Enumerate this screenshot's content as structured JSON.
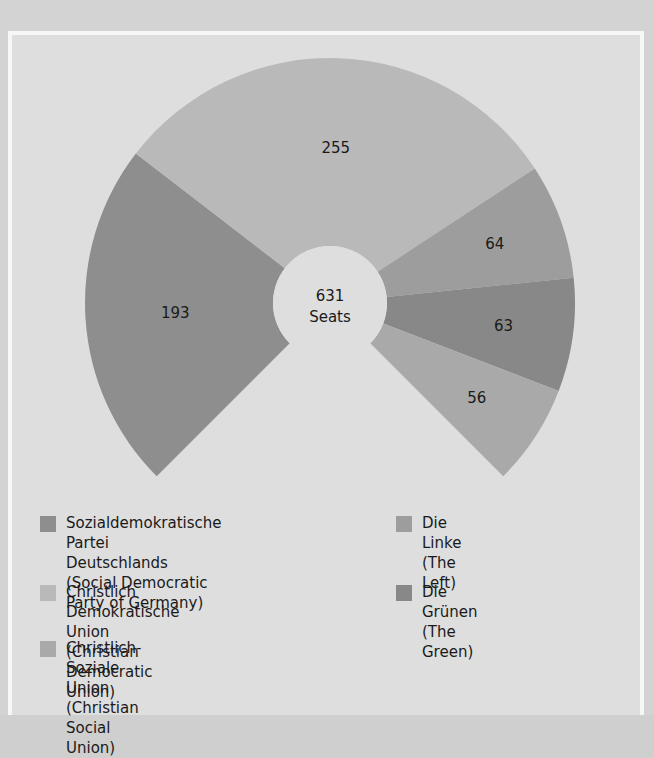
{
  "chart_data": {
    "type": "pie",
    "variant": "donut-270-degree",
    "title": "",
    "center_label": {
      "total": "631",
      "unit": "Seats"
    },
    "total_seats": 631,
    "categories": [
      "Sozialdemokratische Partei Deutschlands (Social Democratic Party of Germany)",
      "Christlich Demokratische Union (Christian Democratic Union)",
      "Die Linke (The Left)",
      "Die Grünen (The Green)",
      "Christlich-Soziale Union (Christian Social Union)"
    ],
    "values": [
      193,
      255,
      64,
      63,
      56
    ],
    "slices": [
      {
        "key": "spd",
        "label": "193",
        "value": 193,
        "color": "#8e8e8e"
      },
      {
        "key": "cdu",
        "label": "255",
        "value": 255,
        "color": "#b9b9b9"
      },
      {
        "key": "linke",
        "label": "64",
        "value": 64,
        "color": "#9d9d9d"
      },
      {
        "key": "gruene",
        "label": "63",
        "value": 63,
        "color": "#888888"
      },
      {
        "key": "csu",
        "label": "56",
        "value": 56,
        "color": "#a9a9a9"
      }
    ],
    "legend_position": "bottom",
    "grid": false
  },
  "legend": {
    "items": [
      {
        "key": "spd",
        "label": "Sozialdemokratische Partei\nDeutschlands (Social Democratic\nParty of Germany)",
        "color": "#8e8e8e"
      },
      {
        "key": "cdu",
        "label": "Christlich Demokratische Union\n(Christian Democratic Union)",
        "color": "#b9b9b9"
      },
      {
        "key": "csu",
        "label": "Christlich-Soziale Union\n(Christian Social Union)",
        "color": "#a9a9a9"
      },
      {
        "key": "linke",
        "label": "Die Linke (The Left)",
        "color": "#9d9d9d"
      },
      {
        "key": "gruene",
        "label": "Die Grünen (The Green)",
        "color": "#888888"
      }
    ]
  }
}
